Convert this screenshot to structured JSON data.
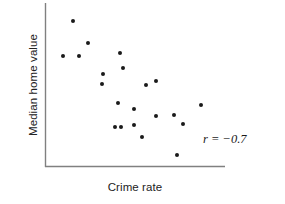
{
  "chart_data": {
    "type": "scatter",
    "title": "",
    "xlabel": "Crime rate",
    "ylabel": "Median home value",
    "grid": false,
    "legend": null,
    "xlim": [
      0,
      1
    ],
    "ylim": [
      0,
      1
    ],
    "axis_ticks": {
      "x": [],
      "y": []
    },
    "annotations": [
      {
        "name": "correlation-coefficient",
        "text": "r = −0.7",
        "value": -0.7,
        "x": 0.88,
        "y": 0.21
      }
    ],
    "points": [
      {
        "x": 0.156,
        "y": 0.89
      },
      {
        "x": 0.239,
        "y": 0.756
      },
      {
        "x": 0.1,
        "y": 0.677
      },
      {
        "x": 0.189,
        "y": 0.677
      },
      {
        "x": 0.417,
        "y": 0.695
      },
      {
        "x": 0.322,
        "y": 0.567
      },
      {
        "x": 0.433,
        "y": 0.604
      },
      {
        "x": 0.317,
        "y": 0.506
      },
      {
        "x": 0.561,
        "y": 0.5
      },
      {
        "x": 0.617,
        "y": 0.524
      },
      {
        "x": 0.406,
        "y": 0.39
      },
      {
        "x": 0.494,
        "y": 0.354
      },
      {
        "x": 0.867,
        "y": 0.378
      },
      {
        "x": 0.617,
        "y": 0.311
      },
      {
        "x": 0.717,
        "y": 0.317
      },
      {
        "x": 0.389,
        "y": 0.244
      },
      {
        "x": 0.422,
        "y": 0.244
      },
      {
        "x": 0.494,
        "y": 0.256
      },
      {
        "x": 0.767,
        "y": 0.262
      },
      {
        "x": 0.539,
        "y": 0.183
      },
      {
        "x": 0.733,
        "y": 0.073
      }
    ]
  },
  "colors": {
    "point": "#1a1a1a",
    "axis": "#808080",
    "text": "#222222",
    "background": "#ffffff"
  },
  "axis_titles": {
    "x": "Crime rate",
    "y": "Median home value"
  }
}
